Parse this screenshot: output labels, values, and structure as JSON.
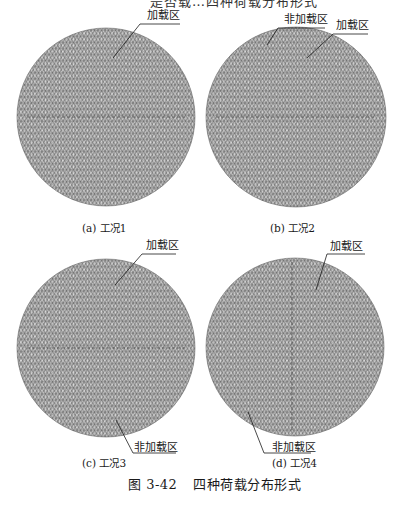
{
  "figure": {
    "number": "图 3-42",
    "title": "四种荷载分布形式",
    "line_color": "#1a1a1a",
    "mesh_color": "#555555",
    "background": "#ffffff"
  },
  "top_strip": {
    "text_fragment": "是否载…四种荷载分布形式"
  },
  "panels": [
    {
      "id": "a",
      "caption": "(a)  工况1",
      "center": [
        106,
        117
      ],
      "radius": 89,
      "labels": [
        {
          "text": "加载区",
          "pos": [
            147,
            10
          ],
          "leader": [
            [
              180,
              24
            ],
            [
              140,
              24
            ],
            [
              113,
              58
            ]
          ]
        }
      ]
    },
    {
      "id": "b",
      "caption": "(b)  工况2",
      "center": [
        296,
        117
      ],
      "radius": 90,
      "labels": [
        {
          "text": "非加载区",
          "pos": [
            284,
            14
          ],
          "leader": [
            [
              325,
              28
            ],
            [
              278,
              28
            ],
            [
              267,
              45
            ]
          ]
        },
        {
          "text": "加载区",
          "pos": [
            336,
            20
          ],
          "leader": [
            [
              368,
              34
            ],
            [
              333,
              34
            ],
            [
              307,
              58
            ]
          ]
        }
      ]
    },
    {
      "id": "c",
      "caption": "(c)  工况3",
      "center": [
        106,
        348
      ],
      "radius": 89,
      "labels": [
        {
          "text": "加载区",
          "pos": [
            146,
            240
          ],
          "leader": [
            [
              176,
              254
            ],
            [
              142,
              254
            ],
            [
              115,
              285
            ]
          ]
        },
        {
          "text": "非加载区",
          "pos": [
            134,
            442
          ],
          "leader": [
            [
              176,
              453
            ],
            [
              133,
              453
            ],
            [
              116,
              420
            ]
          ]
        }
      ]
    },
    {
      "id": "d",
      "caption": "(d)  工况4",
      "center": [
        295,
        347
      ],
      "radius": 89,
      "labels": [
        {
          "text": "加载区",
          "pos": [
            330,
            241
          ],
          "leader": [
            [
              365,
              254
            ],
            [
              327,
              254
            ],
            [
              316,
              290
            ]
          ]
        },
        {
          "text": "非加载区",
          "pos": [
            272,
            442
          ],
          "leader": [
            [
              311,
              453
            ],
            [
              264,
              453
            ],
            [
              248,
              412
            ]
          ]
        }
      ]
    }
  ],
  "captions_pos": {
    "a": [
      82,
      222
    ],
    "b": [
      270,
      222
    ],
    "c": [
      82,
      457
    ],
    "d": [
      272,
      457
    ]
  },
  "fig_caption_pos": [
    128,
    478
  ]
}
